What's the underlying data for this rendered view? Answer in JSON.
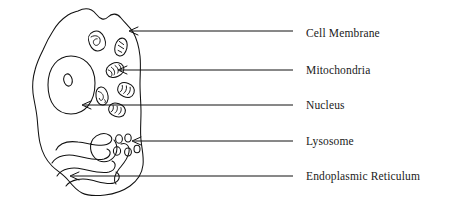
{
  "figure": {
    "background_color": "#ffffff",
    "ink_color": "#111111",
    "width": 464,
    "height": 208
  },
  "labels": [
    {
      "id": "cell-membrane",
      "text": "Cell Membrane",
      "label_x": 306,
      "label_y": 33,
      "line_start_x": 293,
      "line_end_x": 131,
      "line_y": 31,
      "arrow_tip_x": 129,
      "arrow_tip_y": 31,
      "target": "outer boundary of the cell"
    },
    {
      "id": "mitochondria",
      "text": "Mitochondria",
      "label_x": 306,
      "label_y": 70,
      "line_start_x": 293,
      "line_end_x": 120,
      "line_y": 70,
      "arrow_tip_x": 118,
      "arrow_tip_y": 70,
      "target": "bean-shaped organelle with cristae"
    },
    {
      "id": "nucleus",
      "text": "Nucleus",
      "label_x": 306,
      "label_y": 105,
      "line_start_x": 293,
      "line_end_x": 84,
      "line_y": 105,
      "arrow_tip_x": 82,
      "arrow_tip_y": 105,
      "target": "large oval body containing nucleolus"
    },
    {
      "id": "lysosome",
      "text": "Lysosome",
      "label_x": 306,
      "label_y": 141,
      "line_start_x": 293,
      "line_end_x": 134,
      "line_y": 141,
      "arrow_tip_x": 132,
      "arrow_tip_y": 141,
      "target": "cluster of five small circular vesicles"
    },
    {
      "id": "endoplasmic-reticulum",
      "text": "Endoplasmic Reticulum",
      "label_x": 306,
      "label_y": 176,
      "line_start_x": 293,
      "line_end_x": 72,
      "line_y": 176,
      "arrow_tip_x": 70,
      "arrow_tip_y": 176,
      "target": "folded serpentine membrane network"
    }
  ],
  "structures": {
    "cell_membrane": {
      "name": "cell membrane outline",
      "shape": "irregular closed blob"
    },
    "nucleus": {
      "name": "nucleus",
      "shape": "oval",
      "center_x": 71,
      "center_y": 85,
      "radius_x": 24,
      "radius_y": 29,
      "nucleolus": {
        "name": "nucleolus",
        "center_x": 68,
        "center_y": 80,
        "radius_x": 4,
        "radius_y": 6
      }
    },
    "mitochondria": {
      "name": "mitochondria",
      "count": 6,
      "items": [
        {
          "cx": 97,
          "cy": 41,
          "rx": 8,
          "ry": 10,
          "rot": -20
        },
        {
          "cx": 121,
          "cy": 47,
          "rx": 5.5,
          "ry": 9,
          "rot": 15
        },
        {
          "cx": 115,
          "cy": 70,
          "rx": 9,
          "ry": 6.5,
          "rot": -25
        },
        {
          "cx": 126,
          "cy": 90,
          "rx": 8.5,
          "ry": 7,
          "rot": 20
        },
        {
          "cx": 102,
          "cy": 96,
          "rx": 6,
          "ry": 9,
          "rot": -8
        },
        {
          "cx": 117,
          "cy": 110,
          "rx": 8.5,
          "ry": 6,
          "rot": 18
        }
      ]
    },
    "lysosome": {
      "name": "lysosome vesicle cluster",
      "count": 5,
      "items": [
        {
          "cx": 119,
          "cy": 139,
          "rx": 3.4,
          "ry": 4.2
        },
        {
          "cx": 128,
          "cy": 138,
          "rx": 3.2,
          "ry": 4.0
        },
        {
          "cx": 117,
          "cy": 151,
          "rx": 3.6,
          "ry": 4.2
        },
        {
          "cx": 128,
          "cy": 152,
          "rx": 3.4,
          "ry": 4.0
        },
        {
          "cx": 137,
          "cy": 149,
          "rx": 3.0,
          "ry": 3.8
        }
      ]
    },
    "endoplasmic_reticulum": {
      "name": "endoplasmic reticulum",
      "shape": "serpentine folded membrane"
    }
  }
}
